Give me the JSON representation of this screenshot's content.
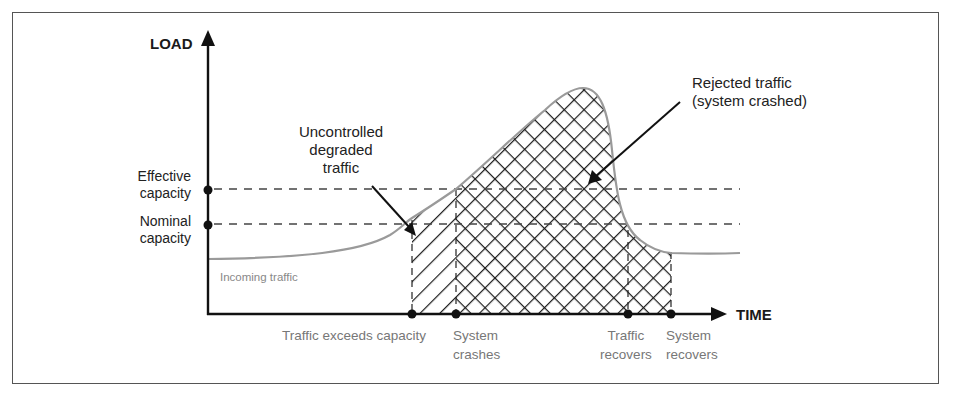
{
  "diagram": {
    "y_axis": {
      "label": "LOAD"
    },
    "x_axis": {
      "label": "TIME"
    },
    "levels": [
      {
        "id": "effective",
        "line1": "Effective",
        "line2": "capacity"
      },
      {
        "id": "nominal",
        "line1": "Nominal",
        "line2": "capacity"
      }
    ],
    "curve_label": "Incoming traffic",
    "annotations": {
      "uncontrolled": {
        "line1": "Uncontrolled",
        "line2": "degraded",
        "line3": "traffic"
      },
      "rejected": {
        "line1": "Rejected traffic",
        "line2": "(system crashed)"
      }
    },
    "events": [
      {
        "id": "exceeds",
        "line1": "Traffic exceeds capacity",
        "line2": ""
      },
      {
        "id": "crashes",
        "line1": "System",
        "line2": "crashes"
      },
      {
        "id": "traffic-recovers",
        "line1": "Traffic",
        "line2": "recovers"
      },
      {
        "id": "system-recovers",
        "line1": "System",
        "line2": "recovers"
      }
    ],
    "colors": {
      "axis": "#111111",
      "curve": "#9a9a9a",
      "hatch": "#1a1a1a",
      "dashed": "#444444",
      "muted_text": "#777777"
    }
  }
}
